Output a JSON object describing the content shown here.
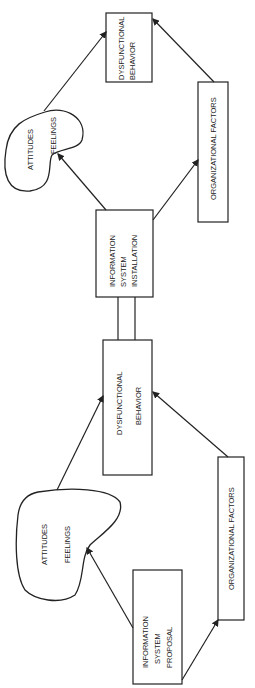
{
  "diagram": {
    "orientation": "rotated-90-ccw",
    "stage_top": {
      "attitudes_label": "ATTITUDES",
      "feelings_label": "FEELINGS",
      "dysfunctional_line1": "DYSFUNCTIONAL",
      "dysfunctional_line2": "BEHAVIOR",
      "org_factors_label": "ORGANIZATIONAL FACTORS"
    },
    "installation": {
      "line1": "INFORMATION",
      "line2": "SYSTEM",
      "line3": "INSTALLATION"
    },
    "stage_bottom": {
      "attitudes_label": "ATTITUDES",
      "feelings_label": "FEELINGS",
      "dysfunctional_line1": "DYSFUNCTIONAL",
      "dysfunctional_line2": "BEHAVIOR",
      "org_factors_label": "ORGANIZATIONAL FACTORS"
    },
    "proposal": {
      "line1": "INFORMATION",
      "line2": "SYSTEM",
      "line3": "PROPOSAL"
    },
    "colors": {
      "stroke": "#222222",
      "background": "#ffffff"
    }
  }
}
